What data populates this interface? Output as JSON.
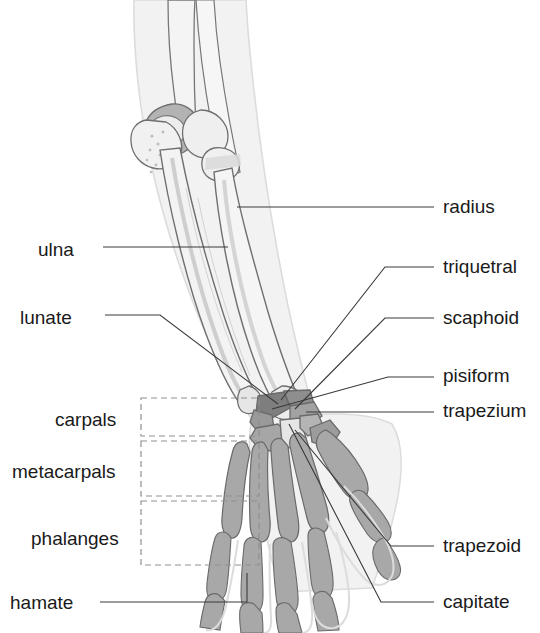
{
  "figure": {
    "background_color": "#ffffff",
    "label_color": "#1a1a1a",
    "leader_line_color": "#3a3a3a",
    "dashed_box_color": "#8f8f8f",
    "bone_colors": {
      "soft_tissue": "#f2f2f2",
      "soft_tissue_outline": "#d8d8d8",
      "bone_light": "#ededed",
      "bone_outline": "#6e6e6e",
      "bone_mid": "#a9a9a9",
      "bone_dark": "#8a8a8a",
      "bone_darkest": "#767676",
      "bone_pale": "#e2e2e2"
    }
  },
  "labels": {
    "left": [
      {
        "id": "ulna",
        "text": "ulna",
        "x": 38,
        "y": 252
      },
      {
        "id": "lunate",
        "text": "lunate",
        "x": 20,
        "y": 320
      },
      {
        "id": "carpals",
        "text": "carpals",
        "x": 55,
        "y": 424
      },
      {
        "id": "metacarpals",
        "text": "metacarpals",
        "x": 12,
        "y": 476
      },
      {
        "id": "phalanges",
        "text": "phalanges",
        "x": 31,
        "y": 543
      },
      {
        "id": "hamate",
        "text": "hamate",
        "x": 10,
        "y": 608
      }
    ],
    "right": [
      {
        "id": "radius",
        "text": "radius",
        "x": 443,
        "y": 214
      },
      {
        "id": "triquetral",
        "text": "triquetral",
        "x": 443,
        "y": 274
      },
      {
        "id": "scaphoid",
        "text": "scaphoid",
        "x": 443,
        "y": 325
      },
      {
        "id": "pisiform",
        "text": "pisiform",
        "x": 443,
        "y": 383
      },
      {
        "id": "trapezium",
        "text": "trapezium",
        "x": 443,
        "y": 418
      },
      {
        "id": "trapezoid",
        "text": "trapezoid",
        "x": 443,
        "y": 553
      },
      {
        "id": "capitate",
        "text": "capitate",
        "x": 443,
        "y": 609
      }
    ]
  },
  "grouping_boxes": [
    {
      "id": "carpals-box",
      "label": "carpals",
      "x": 141,
      "y": 398,
      "width": 118,
      "height": 38
    },
    {
      "id": "metacarpals-box",
      "label": "metacarpals",
      "x": 141,
      "y": 441,
      "width": 118,
      "height": 55
    },
    {
      "id": "phalanges-box",
      "label": "phalanges",
      "x": 141,
      "y": 501,
      "width": 118,
      "height": 64
    }
  ],
  "leader_lines": [
    {
      "id": "ulna-leader",
      "points": "103,247 228,247"
    },
    {
      "id": "lunate-leader",
      "points": "105,315 160,315 278,404"
    },
    {
      "id": "hamate-leader",
      "points": "100,602 247,602 247,573"
    },
    {
      "id": "radius-leader",
      "points": "237,207 434,207"
    },
    {
      "id": "triquetral-leader",
      "points": "434,267 385,267 281,400"
    },
    {
      "id": "scaphoid-leader",
      "points": "434,318 385,318 295,409"
    },
    {
      "id": "pisiform-leader",
      "points": "434,377 388,377 272,409"
    },
    {
      "id": "trapezium-leader",
      "points": "434,412 306,412"
    },
    {
      "id": "trapezoid-leader",
      "points": "434,546 391,546 295,430"
    },
    {
      "id": "capitate-leader",
      "points": "434,602 381,602 289,424"
    }
  ]
}
